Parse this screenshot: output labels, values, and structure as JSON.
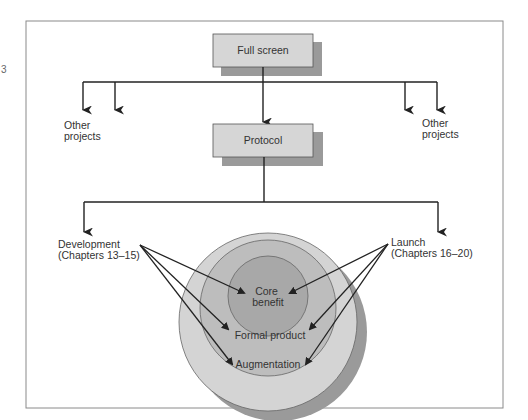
{
  "diagram": {
    "page_marker": "3",
    "nodes": {
      "top": {
        "label": "Full screen"
      },
      "middle": {
        "label": "Protocol"
      },
      "other_left": {
        "line1": "Other",
        "line2": "projects"
      },
      "other_right": {
        "line1": "Other",
        "line2": "projects"
      },
      "development": {
        "line1": "Development",
        "line2": "(Chapters 13–15)"
      },
      "launch": {
        "line1": "Launch",
        "line2": "(Chapters 16–20)"
      }
    },
    "rings": {
      "inner": {
        "line1": "Core",
        "line2": "benefit"
      },
      "middle": {
        "label": "Formal product"
      },
      "outer": {
        "label": "Augmentation"
      }
    },
    "colors": {
      "box_fill": "#d6d6d6",
      "shadow": "#9a9a9a",
      "ring_outer": "#d4d4d4",
      "ring_middle": "#bdbdbd",
      "ring_inner": "#a8a8a8",
      "line": "#222222",
      "frame": "#8a8a8a"
    }
  }
}
